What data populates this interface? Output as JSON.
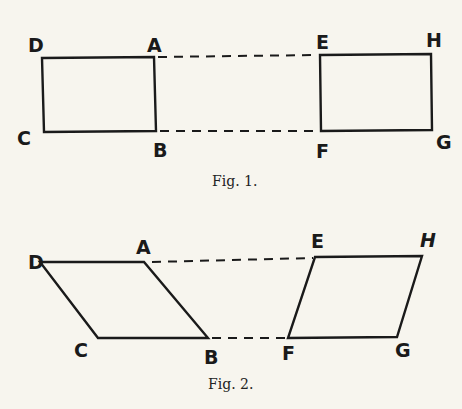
{
  "figures": [
    {
      "caption": "Fig. 1.",
      "shape": "rectangles",
      "labels": {
        "D": "D",
        "A": "A",
        "C": "C",
        "B": "B",
        "E": "E",
        "H": "H",
        "F": "F",
        "G": "G"
      }
    },
    {
      "caption": "Fig. 2.",
      "shape": "parallelograms",
      "labels": {
        "D": "D",
        "A": "A",
        "C": "C",
        "B": "B",
        "E": "E",
        "H": "H",
        "F": "F",
        "G": "G"
      }
    }
  ],
  "colors": {
    "background": "#f7f5ee",
    "ink": "#1a1a1a"
  }
}
